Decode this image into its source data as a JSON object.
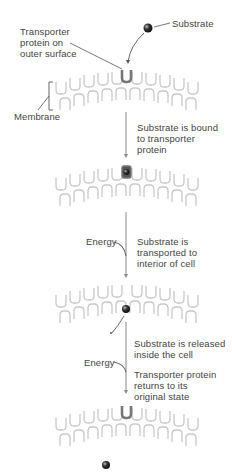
{
  "diagram": {
    "type": "process-flow",
    "title_fragment": "",
    "colors": {
      "membrane": "#c8c8c8",
      "transporter": "#777777",
      "substrate": "#222222",
      "arrow": "#888888",
      "text": "#444444"
    },
    "labels": {
      "substrate": "Substrate",
      "transporter": [
        "Transporter",
        "protein  on",
        "outer surface"
      ],
      "membrane": "Membrane",
      "energy_1": "Energy",
      "energy_2": "Energy"
    },
    "steps": [
      {
        "id": "step-1",
        "text": [
          "Substrate is bound",
          "to transporter",
          "protein"
        ]
      },
      {
        "id": "step-2",
        "text": [
          "Substrate is",
          "transported to",
          "interior of cell"
        ]
      },
      {
        "id": "step-3a",
        "text": [
          "Substrate is released",
          "inside the cell"
        ]
      },
      {
        "id": "step-3b",
        "text": [
          "Transporter protein",
          "returns to its",
          "original state"
        ]
      }
    ]
  }
}
